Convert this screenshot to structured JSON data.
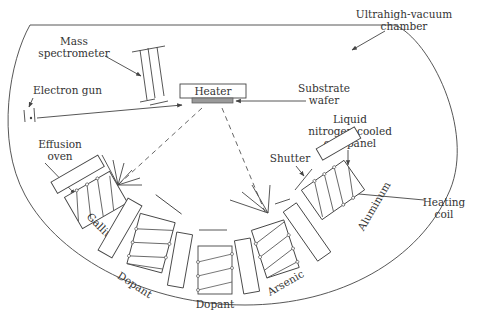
{
  "diagram": {
    "labels": {
      "chamber": [
        "Ultrahigh-vacuum",
        "chamber"
      ],
      "mass_spec": [
        "Mass",
        "spectrometer"
      ],
      "electron_gun": "Electron gun",
      "heater": "Heater",
      "substrate": [
        "Substrate",
        "wafer"
      ],
      "cryopanel": [
        "Liquid",
        "nitrogen-cooled",
        "cryopanel"
      ],
      "effusion_oven": [
        "Effusion",
        "oven"
      ],
      "shutter": "Shutter",
      "heating_coil": [
        "Heating",
        "coil"
      ]
    },
    "sources": [
      {
        "name": "Gallium",
        "label": "Gallium"
      },
      {
        "name": "Dopant-1",
        "label": "Dopant"
      },
      {
        "name": "Dopant-2",
        "label": "Dopant"
      },
      {
        "name": "Arsenic",
        "label": "Arsenic"
      },
      {
        "name": "Aluminum",
        "label": "Aluminum"
      }
    ],
    "colors": {
      "line": "#444444",
      "substrate_fill": "#9a9a9a",
      "text": "#333333"
    }
  }
}
